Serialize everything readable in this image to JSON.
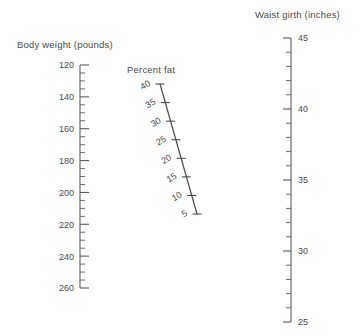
{
  "figure": {
    "kind": "nomogram",
    "background_color": "#ffffff",
    "line_color": "#4a4a4a",
    "text_color": "#4a4a4a"
  },
  "chart_data": {
    "type": "line",
    "title": "",
    "subtitle": "",
    "xlabel": "",
    "ylabel": "",
    "grid": false,
    "legend": "none",
    "scales": [
      {
        "name": "body-weight",
        "title": "Body weight (pounds)",
        "units": "pounds",
        "orientation": "vertical",
        "direction": "top-is-minimum",
        "range": [
          120,
          260
        ],
        "major_step": 20,
        "minor_step": 5,
        "tick_side": "right",
        "major_ticks": [
          120,
          140,
          160,
          180,
          200,
          220,
          240,
          260
        ],
        "labels": [
          "120",
          "140",
          "160",
          "180",
          "200",
          "220",
          "240",
          "260"
        ],
        "geometry": {
          "x": 80,
          "y_start": 65,
          "y_end": 288,
          "major_len": 9,
          "minor_len": 5
        },
        "title_pos": {
          "x": 17,
          "y": 48
        }
      },
      {
        "name": "percent-fat",
        "title": "Percent fat",
        "units": "percent",
        "orientation": "diagonal",
        "direction": "top-left-is-maximum",
        "range": [
          5,
          40
        ],
        "major_step": 5,
        "minor_step": 0,
        "tick_side": "across",
        "major_ticks": [
          40,
          35,
          30,
          25,
          20,
          15,
          10,
          5
        ],
        "labels": [
          "40",
          "35",
          "30",
          "25",
          "20",
          "15",
          "10",
          "5"
        ],
        "label_rotation": -30,
        "geometry": {
          "x_start": 160,
          "y_start": 84,
          "x_end": 197,
          "y_end": 214,
          "tick_len": 9
        },
        "title_pos": {
          "x": 127,
          "y": 73
        }
      },
      {
        "name": "waist-girth",
        "title": "Waist girth (inches)",
        "units": "inches",
        "orientation": "vertical",
        "direction": "top-is-maximum",
        "range": [
          25,
          45
        ],
        "major_step": 5,
        "minor_step": 1,
        "tick_side": "left",
        "major_ticks": [
          45,
          40,
          35,
          30,
          25
        ],
        "labels": [
          "45",
          "40",
          "35",
          "30",
          "25"
        ],
        "geometry": {
          "x": 291,
          "y_start": 38,
          "y_end": 322,
          "major_len": 8,
          "minor_len": 5
        },
        "title_pos": {
          "x": 255,
          "y": 18
        }
      }
    ]
  }
}
